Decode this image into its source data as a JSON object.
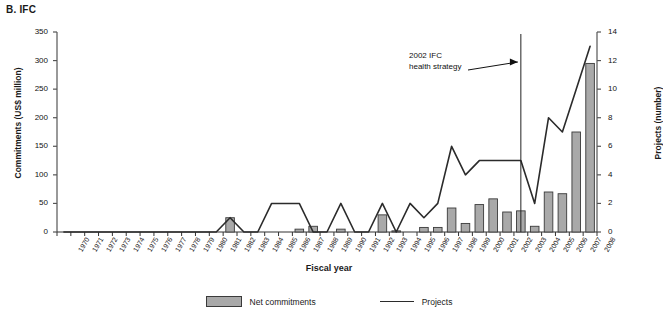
{
  "panel": {
    "title": "B. IFC"
  },
  "axes": {
    "left": {
      "title": "Commitments (US$ million)",
      "ticks": [
        0,
        50,
        100,
        150,
        200,
        250,
        300,
        350
      ],
      "min": 0,
      "max": 350
    },
    "right": {
      "title": "Projects (number)",
      "ticks": [
        0,
        2,
        4,
        6,
        8,
        10,
        12,
        14
      ],
      "min": 0,
      "max": 14
    },
    "x": {
      "title": "Fiscal year"
    }
  },
  "annotation": {
    "line1": "2002 IFC",
    "line2": "health strategy",
    "marker_year": 2003
  },
  "legend": {
    "items": [
      {
        "label": "Net commitments",
        "type": "bar",
        "color": "#a9a9a9"
      },
      {
        "label": "Projects",
        "type": "line",
        "color": "#2b2b2b"
      }
    ]
  },
  "chart_data": {
    "type": "bar",
    "title": "B. IFC",
    "xlabel": "Fiscal year",
    "ylabel": "Commitments (US$ million)",
    "ylabel_secondary": "Projects (number)",
    "ylim": [
      0,
      350
    ],
    "ylim_secondary": [
      0,
      14
    ],
    "grid": false,
    "legend_position": "bottom",
    "categories": [
      "1970",
      "1971",
      "1972",
      "1973",
      "1974",
      "1975",
      "1976",
      "1977",
      "1978",
      "1979",
      "1980",
      "1981",
      "1982",
      "1983",
      "1984",
      "1985",
      "1986",
      "1987",
      "1988",
      "1989",
      "1990",
      "1991",
      "1992",
      "1993",
      "1994",
      "1995",
      "1996",
      "1997",
      "1998",
      "1999",
      "2000",
      "2001",
      "2002",
      "2003",
      "2004",
      "2005",
      "2006",
      "2007",
      "2008"
    ],
    "series": [
      {
        "name": "Net commitments",
        "axis": "left",
        "type": "bar",
        "unit": "US$ million",
        "values": [
          0,
          0,
          0,
          0,
          0,
          0,
          0,
          0,
          0,
          0,
          0,
          0,
          25,
          0,
          0,
          0,
          0,
          5,
          10,
          0,
          5,
          0,
          0,
          30,
          2,
          0,
          8,
          8,
          42,
          15,
          48,
          58,
          35,
          37,
          10,
          70,
          67,
          175,
          295
        ]
      },
      {
        "name": "Projects",
        "axis": "right",
        "type": "line",
        "unit": "number",
        "values": [
          0,
          0,
          0,
          0,
          0,
          0,
          0,
          0,
          0,
          0,
          0,
          0,
          1,
          0,
          0,
          2,
          2,
          2,
          0,
          0,
          2,
          0,
          0,
          2,
          0,
          2,
          1,
          2,
          6,
          4,
          5,
          5,
          5,
          5,
          2,
          8,
          7,
          10,
          13
        ]
      }
    ],
    "annotations": [
      {
        "text": "2002 IFC health strategy",
        "at_category": "2003",
        "type": "vline-with-arrow"
      }
    ]
  }
}
